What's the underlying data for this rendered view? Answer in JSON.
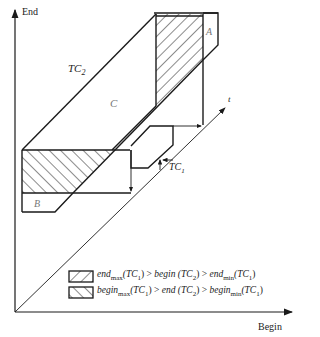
{
  "axes": {
    "y_label": "End",
    "x_label": "Begin",
    "t_label": "t"
  },
  "regions": {
    "tc2_label": "TC",
    "tc2_sub": "2",
    "tc1_label": "TC",
    "tc1_sub": "1",
    "c_label": "C",
    "a_label": "A",
    "b_label": "B"
  },
  "legend": [
    {
      "hatch": "backslash",
      "parts": [
        "end",
        "max",
        "(TC",
        "1",
        ") > ",
        "begin",
        " (TC",
        "2",
        ") > ",
        "end",
        "min",
        "(TC",
        "1",
        ")"
      ]
    },
    {
      "hatch": "slash",
      "parts": [
        "begin",
        "max",
        "(TC",
        "1",
        ") > ",
        "end",
        " (TC",
        "2",
        ") > ",
        "begin",
        "min",
        "(TC",
        "1",
        ")"
      ]
    }
  ],
  "colors": {
    "line": "#1a1a1a",
    "background": "#ffffff",
    "label_gray": "#777777"
  }
}
